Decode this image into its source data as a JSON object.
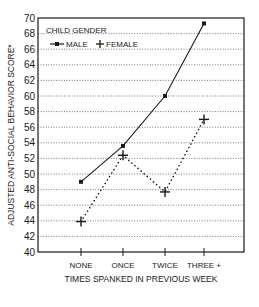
{
  "chart_data": {
    "type": "line",
    "title": "",
    "xlabel": "TIMES SPANKED IN PREVIOUS WEEK",
    "ylabel": "ADJUSTED ANTI-SOCIAL BEHAVIOR SCORE*",
    "categories": [
      "NONE",
      "ONCE",
      "TWICE",
      "THREE +"
    ],
    "ylim": [
      40,
      70
    ],
    "yticks": [
      40,
      42,
      44,
      46,
      48,
      50,
      52,
      54,
      56,
      58,
      60,
      62,
      64,
      66,
      68,
      70
    ],
    "grid": "horizontal dotted",
    "legend": {
      "title": "CHILD GENDER",
      "position": "top-left",
      "entries": [
        "MALE",
        "FEMALE"
      ]
    },
    "series": [
      {
        "name": "MALE",
        "style": "solid line, square markers",
        "values": [
          49,
          53.6,
          60,
          69.3
        ]
      },
      {
        "name": "FEMALE",
        "style": "dotted line, plus markers",
        "values": [
          43.9,
          52.4,
          47.7,
          57
        ]
      }
    ]
  },
  "colors": {
    "ink": "#1a1a1a",
    "grid": "#555555",
    "background": "#ffffff"
  }
}
